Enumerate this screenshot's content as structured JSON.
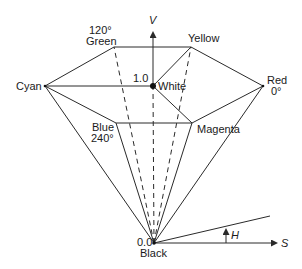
{
  "diagram": {
    "axes": {
      "v_label": "V",
      "s_label": "S",
      "h_label": "H"
    },
    "vertices": {
      "green": {
        "name": "Green",
        "angle": "120°"
      },
      "yellow": {
        "name": "Yellow"
      },
      "cyan": {
        "name": "Cyan"
      },
      "white": {
        "name": "White",
        "value": "1.0"
      },
      "red": {
        "name": "Red",
        "angle": "0°"
      },
      "blue": {
        "name": "Blue",
        "angle": "240°"
      },
      "magenta": {
        "name": "Magenta"
      },
      "black": {
        "name": "Black",
        "value": "0.0"
      }
    },
    "colors": {
      "stroke": "#2a2a2a",
      "text": "#1a1a1a",
      "background": "#ffffff"
    }
  }
}
